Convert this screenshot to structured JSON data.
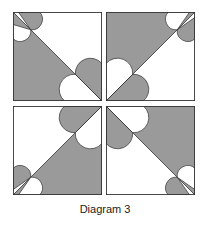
{
  "caption": "Diagram 3",
  "colors": {
    "shade": "#9a9a9a",
    "background": "#ffffff",
    "stroke": "#333333"
  },
  "tiles": [
    {
      "position": "top-left",
      "diagonal": "top-left to bottom-right",
      "shaded_triangle": "lower-left"
    },
    {
      "position": "top-right",
      "diagonal": "bottom-left to top-right",
      "shaded_triangle": "upper-left"
    },
    {
      "position": "bottom-left",
      "diagonal": "bottom-left to top-right",
      "shaded_triangle": "lower-right"
    },
    {
      "position": "bottom-right",
      "diagonal": "top-left to bottom-right",
      "shaded_triangle": "upper-right"
    }
  ]
}
